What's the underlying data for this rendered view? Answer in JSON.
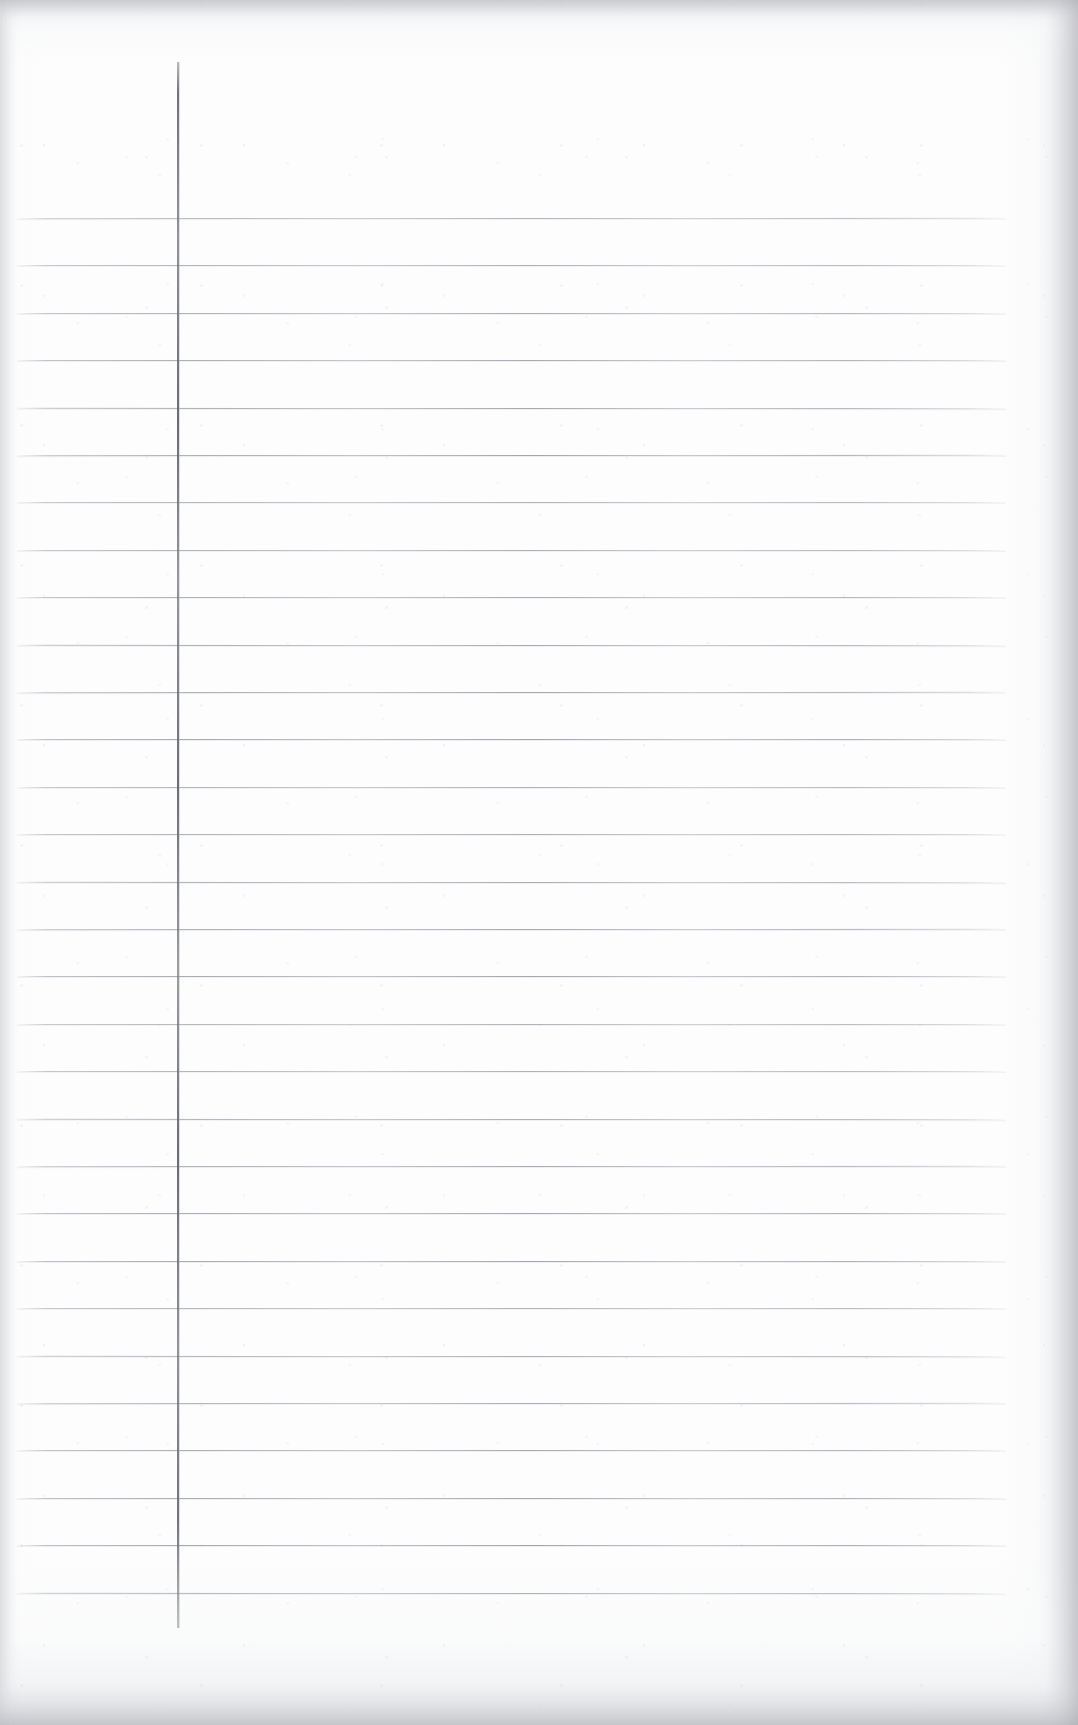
{
  "document": {
    "title": "Blank Ruled Notebook Page",
    "kind": "scanned-page",
    "page_width_px": 1078,
    "page_height_px": 1725,
    "paper_color": "#fdfdfd",
    "has_text_content": false,
    "visible_text": ""
  },
  "ruling": {
    "style": "wide-ruled",
    "horizontal_line_color": "#a4a8b0",
    "horizontal_line_count": 30,
    "horizontal_line_spacing_px": 47.4,
    "first_line_y_px": 218,
    "last_line_y_px": 1600,
    "line_start_x_px": 17,
    "line_end_x_px": 1006,
    "line_thickness_px": 1
  },
  "margin_rule": {
    "label": "vertical-margin-line",
    "color": "#6a6e75",
    "x_px": 177,
    "top_y_px": 62,
    "bottom_y_px": 1628,
    "thickness_px": 2
  },
  "scan_artifacts": {
    "top_edge_band_color": "#e2e3e6",
    "bottom_edge_band_color": "#e0e1e5",
    "right_edge_band_color": "#dedee2",
    "left_edge_band_color": "#eaebee",
    "grain_color": "#ced0d4"
  }
}
